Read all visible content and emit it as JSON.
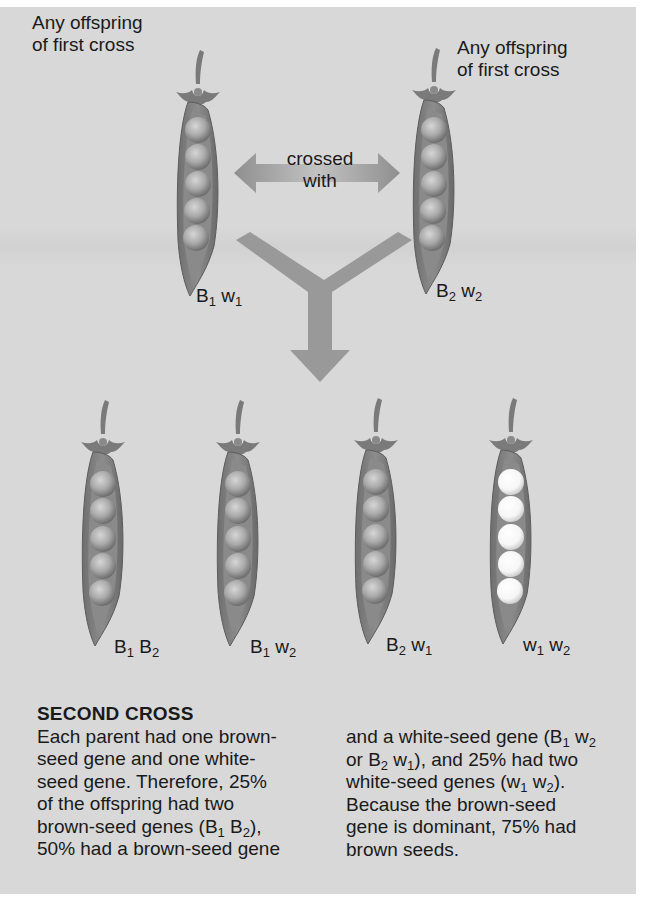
{
  "parents": {
    "left": {
      "caption_line1": "Any offspring",
      "caption_line2": "of first cross",
      "genotype": {
        "a": "B",
        "a_sub": "1",
        "b": "w",
        "b_sub": "1"
      }
    },
    "right": {
      "caption_line1": "Any offspring",
      "caption_line2": "of first cross",
      "genotype": {
        "a": "B",
        "a_sub": "2",
        "b": "w",
        "b_sub": "2"
      }
    }
  },
  "cross_arrow": {
    "line1": "crossed",
    "line2": "with"
  },
  "offspring": [
    {
      "a": "B",
      "a_sub": "1",
      "b": "B",
      "b_sub": "2",
      "seed_color": "brown"
    },
    {
      "a": "B",
      "a_sub": "1",
      "b": "w",
      "b_sub": "2",
      "seed_color": "brown"
    },
    {
      "a": "B",
      "a_sub": "2",
      "b": "w",
      "b_sub": "1",
      "seed_color": "brown"
    },
    {
      "a": "w",
      "a_sub": "1",
      "b": "w",
      "b_sub": "2",
      "seed_color": "white"
    }
  ],
  "explanation": {
    "heading": "SECOND CROSS",
    "col1": [
      "Each parent had one brown-",
      "seed gene and one white-",
      "seed gene. Therefore, 25%",
      "of the offspring had two",
      {
        "pre": "brown-seed genes (B",
        "s1": "1",
        "mid": " B",
        "s2": "2",
        "post": "),"
      },
      "50% had a brown-seed gene"
    ],
    "col2": [
      {
        "pre": "and a white-seed gene (B",
        "s1": "1",
        "mid": " w",
        "s2": "2",
        "post": ""
      },
      {
        "pre": "or B",
        "s1": "2",
        "mid": " w",
        "s2": "1",
        "post": "), and 25% had two"
      },
      {
        "pre": "white-seed genes (w",
        "s1": "1",
        "mid": " w",
        "s2": "2",
        "post": ")."
      },
      "Because the brown-seed",
      "gene is dominant, 75% had",
      "brown seeds."
    ]
  },
  "colors": {
    "panel_bg": "#d8d8d8",
    "pod": "#7d7d7d",
    "pod_inner": "#8f8f8f",
    "brown_seed": "#a9a9a9",
    "white_seed": "#fbfbfb",
    "arrow": "#9a9a9a"
  }
}
